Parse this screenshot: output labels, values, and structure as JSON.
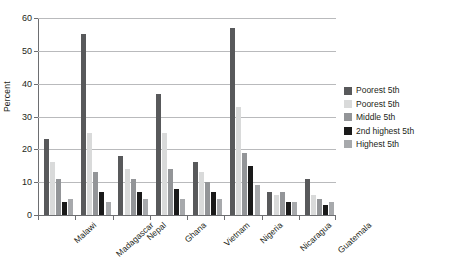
{
  "chart_data": {
    "type": "bar",
    "title": "",
    "xlabel": "",
    "ylabel": "Percent",
    "ylim": [
      0,
      60
    ],
    "yticks": [
      0,
      10,
      20,
      30,
      40,
      50,
      60
    ],
    "grid": true,
    "legend_position": "right",
    "categories": [
      "Malawi",
      "Madagascar",
      "Nepal",
      "Ghana",
      "Vietnam",
      "Nigeria",
      "Nicaragua",
      "Guatemala"
    ],
    "series": [
      {
        "name": "Poorest 5th",
        "color": "#58595b",
        "values": [
          23,
          55,
          18,
          37,
          16,
          57,
          7,
          11
        ]
      },
      {
        "name": "Poorest 5th",
        "color": "#d9dada",
        "values": [
          16,
          25,
          14,
          25,
          13,
          33,
          6,
          6
        ]
      },
      {
        "name": "Middle 5th",
        "color": "#939598",
        "values": [
          11,
          13,
          11,
          14,
          10,
          19,
          7,
          5
        ]
      },
      {
        "name": "2nd highest 5th",
        "color": "#1a1a1a",
        "values": [
          4,
          7,
          7,
          8,
          7,
          15,
          4,
          3
        ]
      },
      {
        "name": "Highest 5th",
        "color": "#a7a9ac",
        "values": [
          5,
          4,
          5,
          5,
          5,
          9,
          4,
          4
        ]
      }
    ]
  },
  "legend": {
    "items": [
      {
        "label": "Poorest 5th",
        "color": "#58595b"
      },
      {
        "label": "Poorest 5th",
        "color": "#d9dada"
      },
      {
        "label": "Middle 5th",
        "color": "#939598"
      },
      {
        "label": "2nd highest 5th",
        "color": "#1a1a1a"
      },
      {
        "label": "Highest 5th",
        "color": "#a7a9ac"
      }
    ]
  }
}
